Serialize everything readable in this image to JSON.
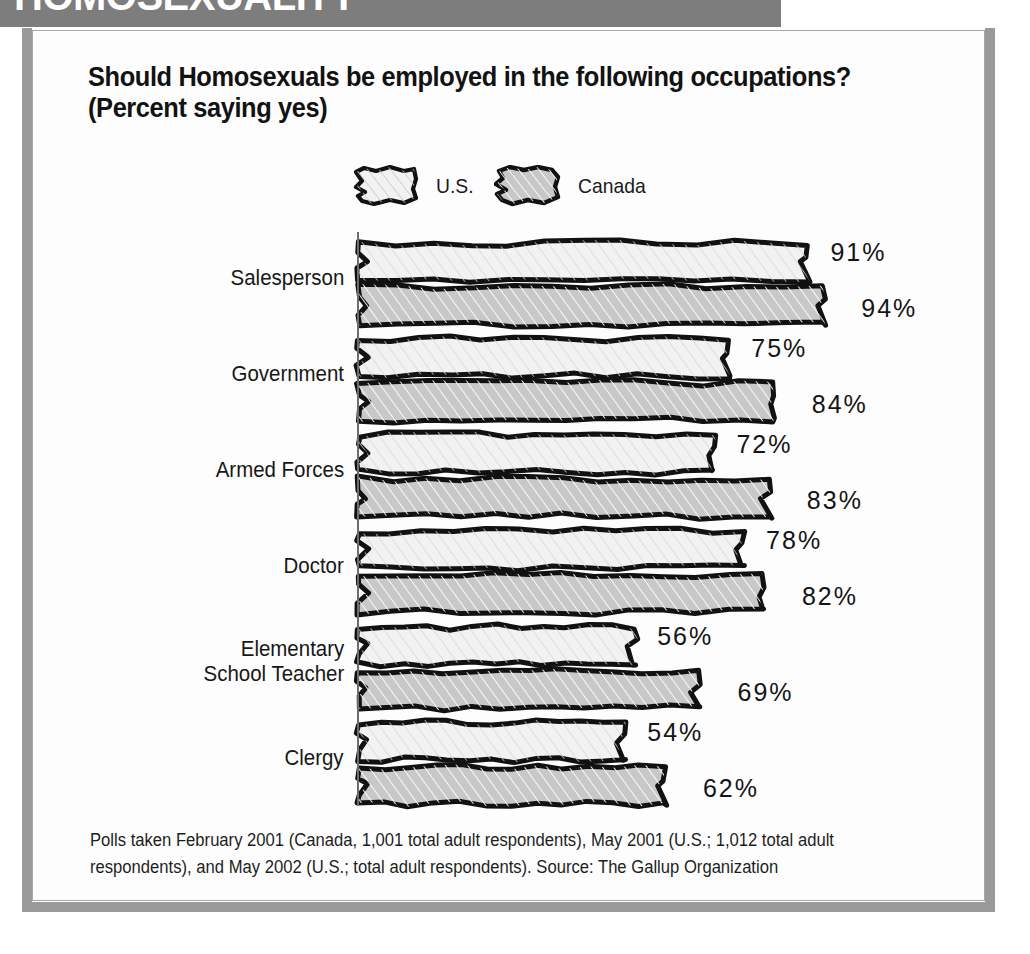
{
  "banner": {
    "headline": "HOMOSEXUALITY"
  },
  "title": {
    "line1": "Should Homosexuals be employed in the following occupations?",
    "line2": "(Percent saying yes)"
  },
  "legend": {
    "items": [
      {
        "label": "U.S.",
        "swatch": "swatch-white-hatched",
        "color": "#f2f2f2"
      },
      {
        "label": "Canada",
        "swatch": "swatch-gray-hatched",
        "color": "#c8c8c8"
      }
    ]
  },
  "footnote": {
    "text": "Polls taken February 2001 (Canada, 1,001 total adult respondents), May 2001 (U.S.; 1,012 total adult respondents), and May 2002 (U.S.; total adult respondents). Source: The Gallup Organization"
  },
  "chart_data": {
    "type": "bar",
    "orientation": "horizontal",
    "title": "Should Homosexuals be employed in the following occupations? (Percent saying yes)",
    "xlabel": "",
    "ylabel": "",
    "xlim": [
      0,
      100
    ],
    "grid": false,
    "legend_position": "top",
    "categories": [
      "Salesperson",
      "Government",
      "Armed Forces",
      "Doctor",
      "Elementary School Teacher",
      "Clergy"
    ],
    "category_lines": [
      [
        "Salesperson"
      ],
      [
        "Government"
      ],
      [
        "Armed Forces"
      ],
      [
        "Doctor"
      ],
      [
        "Elementary",
        "School Teacher"
      ],
      [
        "Clergy"
      ]
    ],
    "series": [
      {
        "name": "U.S.",
        "color": "#f2f2f2",
        "values": [
          91,
          75,
          72,
          78,
          56,
          54
        ],
        "labels": [
          "91%",
          "75%",
          "72%",
          "78%",
          "56%",
          "54%"
        ]
      },
      {
        "name": "Canada",
        "color": "#c8c8c8",
        "values": [
          94,
          84,
          83,
          82,
          69,
          62
        ],
        "labels": [
          "94%",
          "84%",
          "83%",
          "82%",
          "69%",
          "62%"
        ]
      }
    ]
  }
}
